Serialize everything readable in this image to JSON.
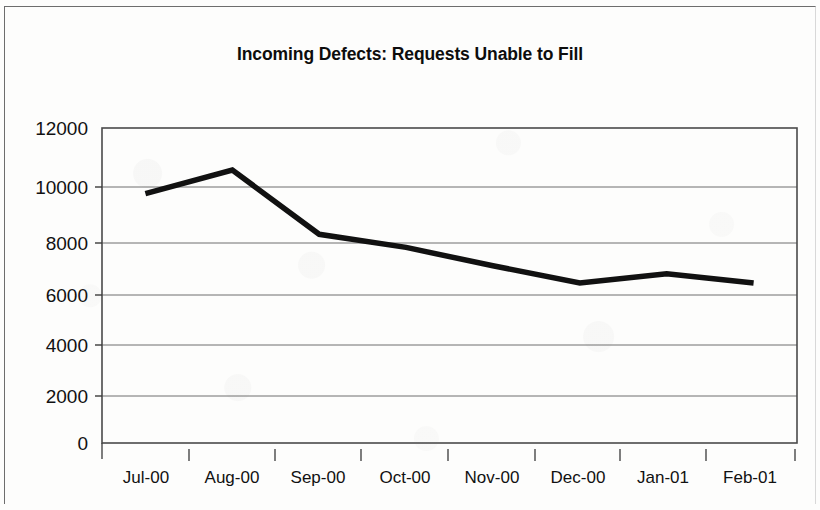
{
  "chart_data": {
    "type": "line",
    "title": "Incoming Defects: Requests Unable to Fill",
    "xlabel": "",
    "ylabel": "",
    "categories": [
      "Jul-00",
      "Aug-00",
      "Sep-00",
      "Oct-00",
      "Nov-00",
      "Dec-00",
      "Jan-01",
      "Feb-01"
    ],
    "values": [
      9500,
      10400,
      7950,
      7450,
      6750,
      6100,
      6450,
      6100
    ],
    "series": [
      {
        "name": "Requests Unable to Fill",
        "values": [
          9500,
          10400,
          7950,
          7450,
          6750,
          6100,
          6450,
          6100
        ]
      }
    ],
    "ylim": [
      0,
      12000
    ],
    "ytick_values": [
      0,
      2000,
      4000,
      6000,
      8000,
      10000,
      12000
    ],
    "ytick_labels": [
      "0",
      "2000",
      "4000",
      "6000",
      "8000",
      "10000",
      "12000"
    ],
    "grid": "horizontal",
    "legend": "none",
    "line_color": "#111111",
    "plot_border_color": "#4a4a4a",
    "gridline_color": "#6e6e6e"
  }
}
